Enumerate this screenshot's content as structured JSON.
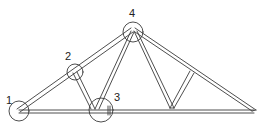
{
  "diagram": {
    "type": "roof-truss",
    "stroke_color": "#3a3a3a",
    "background": "#ffffff",
    "joints": [
      {
        "label": "1",
        "name": "left-heel-joint"
      },
      {
        "label": "2",
        "name": "top-chord-panel-joint"
      },
      {
        "label": "3",
        "name": "bottom-chord-panel-joint"
      },
      {
        "label": "4",
        "name": "peak-joint"
      }
    ]
  }
}
